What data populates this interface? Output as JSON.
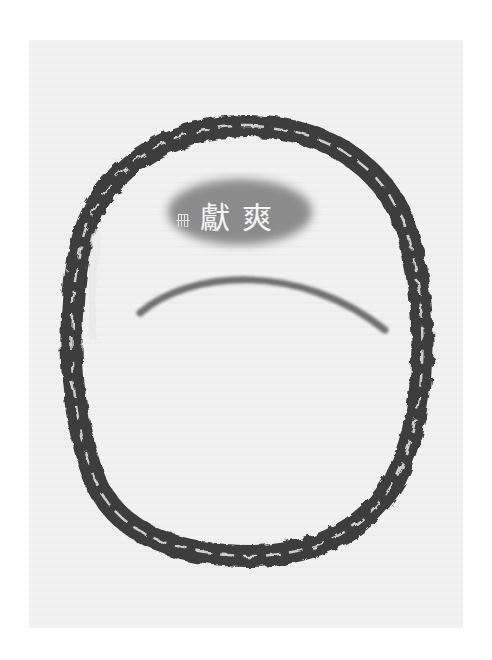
{
  "image": {
    "description": "Ink rubbing of an oval bronze object with a cast inscription",
    "background_color": "#ffffff",
    "paper_color": "#efefef",
    "ink_color": "#1a1a1a"
  },
  "inscription": {
    "small_glyph": "冊",
    "main_glyphs": [
      "獻",
      "爽"
    ]
  }
}
